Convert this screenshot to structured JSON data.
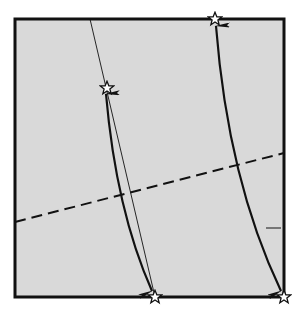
{
  "diagram": {
    "type": "origami-fold-diagram",
    "colors": {
      "background": "#ffffff",
      "paper_fill": "#d9d9d9",
      "frame_stroke": "#111111",
      "line_stroke": "#111111",
      "star_fill": "#ffffff",
      "star_stroke": "#111111"
    },
    "paper": {
      "x": 15,
      "y": 19,
      "width": 269,
      "height": 278
    },
    "thin_line": {
      "x1": 90,
      "y1": 19,
      "x2": 155,
      "y2": 297
    },
    "dashed_line": {
      "x1": 15,
      "y1": 222,
      "x2": 284,
      "y2": 153
    },
    "tick_mark": {
      "x1": 266,
      "y1": 228,
      "x2": 281,
      "y2": 228
    },
    "stars": [
      {
        "id": "star-left-upper",
        "x": 107,
        "y": 88
      },
      {
        "id": "star-top-edge",
        "x": 215,
        "y": 19
      },
      {
        "id": "star-bottom-middle",
        "x": 155,
        "y": 297
      },
      {
        "id": "star-bottom-right",
        "x": 284,
        "y": 297
      }
    ],
    "arrows": [
      {
        "id": "left-fold-arrow",
        "from": "star-left-upper",
        "to": "star-bottom-middle",
        "double_headed": true
      },
      {
        "id": "right-fold-arrow",
        "from": "star-top-edge",
        "to": "star-bottom-right",
        "double_headed": true
      }
    ]
  }
}
